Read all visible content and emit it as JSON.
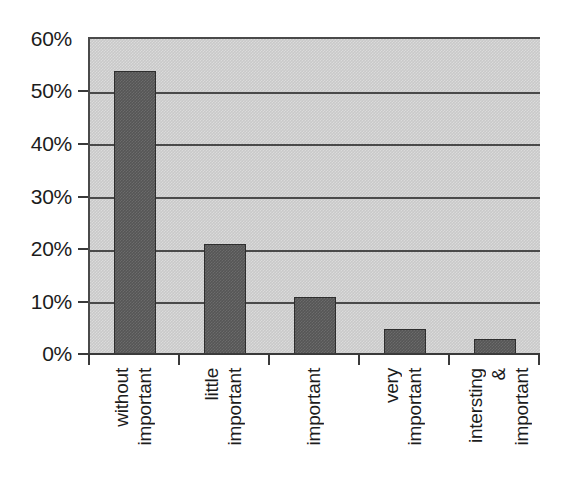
{
  "chart_data": {
    "type": "bar",
    "title": "",
    "subtitle": "",
    "xlabel": "",
    "ylabel": "",
    "categories": [
      "without important",
      "little important",
      "important",
      "very important",
      "intersting & important"
    ],
    "category_lines": [
      [
        "without",
        "important"
      ],
      [
        "little",
        "important"
      ],
      [
        "important"
      ],
      [
        "very",
        "important"
      ],
      [
        "intersting",
        "&",
        "important"
      ]
    ],
    "values": [
      54,
      21,
      11,
      5,
      3
    ],
    "value_labels": [
      "54%",
      "21%",
      "11%",
      "5%",
      "3%"
    ],
    "ylim": [
      0,
      60
    ],
    "y_ticks": [
      0,
      10,
      20,
      30,
      40,
      50,
      60
    ],
    "y_tick_labels": [
      "0%",
      "10%",
      "20%",
      "30%",
      "40%",
      "50%",
      "60%"
    ],
    "grid": true,
    "grid_axis": "y",
    "legend": false,
    "legend_position": "none",
    "series": [
      {
        "name": "Share of respondents",
        "values": [
          54,
          21,
          11,
          5,
          3
        ]
      }
    ],
    "colors": {
      "bar_fill": "#565656",
      "bar_border": "#2e2e2e",
      "plot_background": "#c9c9c9",
      "gridline": "#4a4a4a",
      "axis": "#3a3a3a",
      "text": "#1c1c1c",
      "page_background": "#ffffff"
    }
  }
}
